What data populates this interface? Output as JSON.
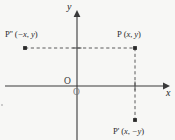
{
  "figure": {
    "type": "cartesian-coordinate-reflection-diagram",
    "width": 175,
    "height": 140,
    "background_color": "#f7f7f5",
    "ink_color": "#2c2c2c"
  },
  "axes": {
    "x_label": "x",
    "y_label": "y",
    "origin_label": "O",
    "origin_label_duplicate": "O",
    "x_axis_y_px": 86,
    "y_axis_x_px": 77,
    "x_range_px": [
      5,
      168
    ],
    "y_range_px": [
      10,
      140
    ],
    "arrowheads": [
      "x-positive",
      "y-positive"
    ],
    "grid": false
  },
  "points": [
    {
      "id": "P",
      "name": "P",
      "label": "P (x, y)",
      "label_prefix": "P",
      "coord_open": "(",
      "coord_x": "x",
      "coord_sep": ", ",
      "coord_y": "y",
      "coord_close": ")",
      "quadrant": "I",
      "px": [
        135,
        48
      ],
      "marker": "square-dot"
    },
    {
      "id": "P2",
      "name": "P''",
      "label": "P'' (−x, y)",
      "label_prefix": "P''",
      "coord_open": "(",
      "coord_x": "−x",
      "coord_sep": ", ",
      "coord_y": "y",
      "coord_close": ")",
      "quadrant": "II",
      "px": [
        25,
        48
      ],
      "marker": "square-dot"
    },
    {
      "id": "P1",
      "name": "P'",
      "label": "P' (x, −y)",
      "label_prefix": "P'",
      "coord_open": "(",
      "coord_x": "x",
      "coord_sep": ", ",
      "coord_y": "−y",
      "coord_close": ")",
      "quadrant": "IV",
      "px": [
        135,
        120
      ],
      "marker": "square-dot"
    }
  ],
  "connectors": [
    {
      "id": "horizontal-dashed",
      "style": "dashed",
      "from_point": "P''",
      "to_point": "P",
      "from_px": [
        25,
        48
      ],
      "to_px": [
        135,
        48
      ]
    },
    {
      "id": "vertical-dashed",
      "style": "dashed",
      "from_point": "P",
      "to_point": "P'",
      "from_px": [
        135,
        48
      ],
      "to_px": [
        135,
        120
      ]
    }
  ],
  "ticks": [
    {
      "id": "x-tick-at-P",
      "axis": "x",
      "px": [
        135,
        86
      ]
    },
    {
      "id": "y-tick-at-P-level",
      "axis": "y",
      "px": [
        77,
        48
      ]
    }
  ]
}
